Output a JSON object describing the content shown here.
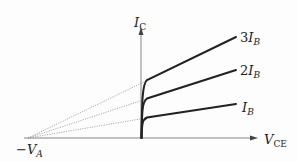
{
  "diagram": {
    "axes": {
      "y_label": {
        "main": "I",
        "sub": "C"
      },
      "x_label": {
        "main": "V",
        "sub": "CE"
      },
      "early_voltage_label": {
        "prefix": "−",
        "main": "V",
        "sub": "A"
      }
    },
    "curves": [
      {
        "label_coef": "3",
        "label_main": "I",
        "label_sub": "B"
      },
      {
        "label_coef": "2",
        "label_main": "I",
        "label_sub": "B"
      },
      {
        "label_coef": "",
        "label_main": "I",
        "label_sub": "B"
      }
    ],
    "colors": {
      "curve": "#222222",
      "axis": "#555555",
      "extrapolation": "#888888"
    }
  }
}
